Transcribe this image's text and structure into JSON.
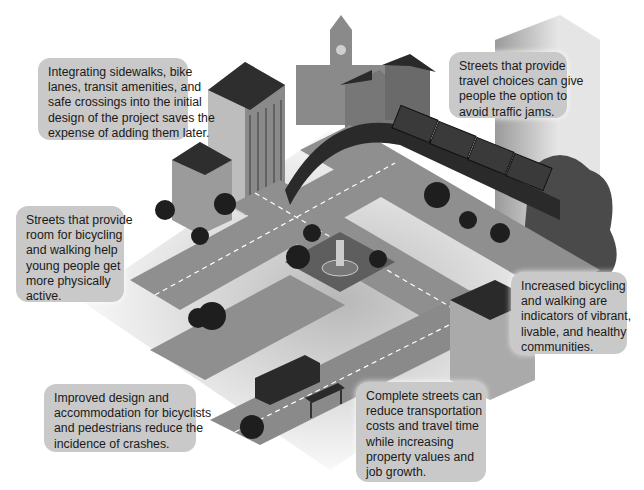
{
  "callouts": [
    {
      "id": "integrating",
      "lines": [
        "Integrating sidewalks, bike",
        "lanes, transit amenities, and",
        "safe crossings into the initial",
        "design of the project saves the",
        "expense of adding them later."
      ]
    },
    {
      "id": "travel-choices",
      "lines": [
        "Streets that provide",
        "travel choices can give",
        "people the option to",
        "avoid traffic jams."
      ]
    },
    {
      "id": "young-people",
      "lines": [
        "Streets that provide",
        "room for bicycling",
        "and walking help",
        "young people get",
        "more physically",
        "active."
      ]
    },
    {
      "id": "vibrant",
      "lines": [
        "Increased bicycling",
        "and walking are",
        "indicators of vibrant,",
        "livable, and healthy",
        "communities."
      ]
    },
    {
      "id": "crashes",
      "lines": [
        "Improved design and",
        "accommodation for bicyclists",
        "and pedestrians reduce the",
        "incidence of crashes."
      ]
    },
    {
      "id": "costs",
      "lines": [
        "Complete streets can",
        "reduce transportation",
        "costs and travel time",
        "while increasing",
        "property values and",
        "job growth."
      ]
    }
  ],
  "colors": {
    "callout_bg": "#c9c9c9",
    "road": "#8f8f8f",
    "sidewalk": "#cfcfcf",
    "dark": "#2a2a2a",
    "plaza": "#5e5e5e"
  }
}
